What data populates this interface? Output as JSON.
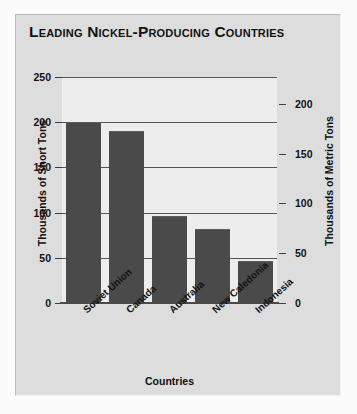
{
  "chart_data": {
    "type": "bar",
    "title": "Leading Nickel-Producing Countries",
    "xlabel": "Countries",
    "ylabel": "Thousands of Short Tons",
    "y2label": "Thousands of Metric Tons",
    "categories": [
      "Soviet Union",
      "Canada",
      "Australia",
      "New Caledonia",
      "Indonesia"
    ],
    "values": [
      200,
      190,
      96,
      82,
      47
    ],
    "series": [
      {
        "name": "Nickel production",
        "values": [
          200,
          190,
          96,
          82,
          47
        ]
      }
    ],
    "ylim": [
      0,
      250
    ],
    "yticks": [
      0,
      50,
      100,
      150,
      200,
      250
    ],
    "yticklabels": [
      "0",
      "50",
      "100",
      "150",
      "200",
      "250"
    ],
    "y2lim": [
      0,
      226.8
    ],
    "y2ticks": [
      0,
      50,
      100,
      150,
      200
    ],
    "y2ticklabels": [
      "0",
      "50",
      "100",
      "150",
      "200"
    ],
    "grid": true,
    "legend": false,
    "bar_color": "#4a4a4a",
    "plot_background": "#ededed",
    "panel_background": "#dddddd",
    "gridline_color": "#555555",
    "text_color": "#111111",
    "xtick_rotation": -42
  }
}
